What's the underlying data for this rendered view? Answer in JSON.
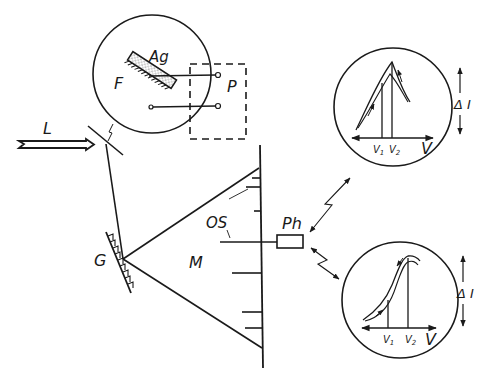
{
  "diagram": {
    "type": "optical experimental setup schematic",
    "labels": {
      "laser": "L",
      "film": "F",
      "silver": "Ag",
      "potentiostat": "P",
      "grating": "G",
      "monochromator": "M",
      "optical_slit": "OS",
      "photomultiplier": "Ph"
    },
    "insets": [
      {
        "id": "top",
        "v1": "V",
        "v1_sub": "1",
        "v2": "V",
        "v2_sub": "2",
        "x_axis": "V",
        "y_axis": "Δ I"
      },
      {
        "id": "bottom",
        "v1": "V",
        "v1_sub": "1",
        "v2": "V",
        "v2_sub": "2",
        "x_axis": "V",
        "y_axis": "Δ I"
      }
    ],
    "colors": {
      "ink": "#1a1a1a",
      "background": "#ffffff"
    }
  }
}
